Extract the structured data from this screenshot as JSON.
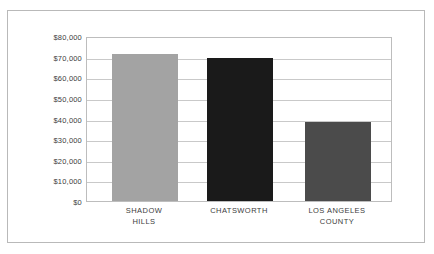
{
  "chart_data": {
    "type": "bar",
    "title": "",
    "subtitle": "",
    "xlabel": "",
    "ylabel": "",
    "categories": [
      "SHADOW\nHILLS",
      "CHATSWORTH",
      "LOS ANGELES\nCOUNTY"
    ],
    "values": [
      72000,
      70000,
      39000
    ],
    "bar_colors": [
      "#a3a3a3",
      "#1a1a1a",
      "#4b4b4b"
    ],
    "ylim": [
      0,
      80000
    ],
    "ytick_values": [
      80000,
      70000,
      60000,
      50000,
      40000,
      30000,
      20000,
      10000,
      0
    ],
    "ytick_labels": [
      "$80,000",
      "$70,000",
      "$60,000",
      "$50,000",
      "$40,000",
      "$30,000",
      "$20,000",
      "$10,000",
      "$0"
    ],
    "grid": true,
    "grid_axis": "y",
    "legend": false,
    "legend_position": "none",
    "annotations": [],
    "colors": {
      "background": "#ffffff",
      "gridline": "#c9c9c9",
      "axis_border": "#bdbdbd",
      "figure_border": "#b9b9b9",
      "tick_text": "#3c3c3c"
    }
  }
}
